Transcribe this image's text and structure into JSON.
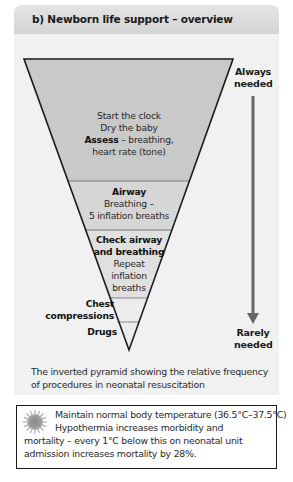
{
  "header": {
    "title": "b) Newborn life support – overview"
  },
  "pyramid": {
    "colors": {
      "level1": "#c9c9c9",
      "level2": "#d6d6d6",
      "level3": "#e0e0e0",
      "level4": "#ececec",
      "level5": "#ececec",
      "outline": "#1a1a1a",
      "arrow": "#666666"
    },
    "levels": [
      {
        "lines": [
          "Start the clock",
          "Dry the baby"
        ],
        "bold_prefix": "Assess",
        "rest": " – breathing,",
        "last": "heart rate (tone)"
      },
      {
        "title": "Airway",
        "lines": [
          "Breathing –",
          "5 inflation breaths"
        ]
      },
      {
        "title1": "Check airway",
        "title2": "and breathing",
        "lines": [
          "Repeat",
          "inflation",
          "breaths"
        ]
      },
      {
        "title1": "Chest",
        "title2": "compressions"
      },
      {
        "title": "Drugs"
      }
    ]
  },
  "frequency_axis": {
    "top_label_1": "Always",
    "top_label_2": "needed",
    "bottom_label_1": "Rarely",
    "bottom_label_2": "needed"
  },
  "caption": {
    "line1": "The inverted pyramid showing the relative frequency",
    "line2": "of procedures in neonatal resuscitation"
  },
  "note": {
    "icon": "sun-icon",
    "line1": "Maintain normal body temperature (36.5°C–37.5°C)",
    "line2": "Hypothermia increases morbidity and",
    "line3": "mortality – every 1°C below this on neonatal unit",
    "line4": "admission increases mortality by 28%."
  }
}
